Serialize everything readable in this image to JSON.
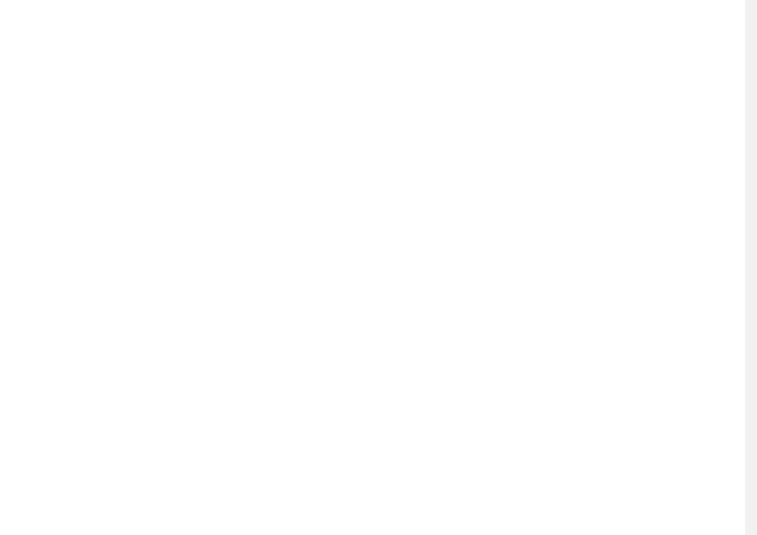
{
  "colors": {
    "line": "#333333",
    "dot": "#111111",
    "big_arrow": "#8a8a8a",
    "edge_strip": "#f1f1f1"
  },
  "top_row": [
    {
      "id": "normal",
      "caption": "Normal field",
      "north_label": "N",
      "center": [
        141,
        162
      ],
      "radius": 9,
      "caption_pos": [
        141,
        269
      ],
      "north_pos": [
        141,
        71
      ],
      "long_arrows": [
        {
          "angle": 90,
          "len": 85
        },
        {
          "angle": 270,
          "len": 100
        },
        {
          "angle": 0,
          "len": 98
        },
        {
          "angle": 180,
          "len": 98
        },
        {
          "angle": 45,
          "len": 75
        },
        {
          "angle": 135,
          "len": 75
        },
        {
          "angle": 225,
          "len": 65
        },
        {
          "angle": 315,
          "len": 75
        }
      ],
      "short_arrows_inward": [
        70,
        110,
        20,
        160,
        200,
        250,
        290,
        340
      ]
    },
    {
      "id": "strong",
      "caption": "9 times stronger field",
      "north_label": "N",
      "center": [
        405,
        162
      ],
      "radius": 9,
      "caption_pos": [
        405,
        289
      ],
      "north_pos": [
        405,
        35
      ],
      "long_arrows": [
        {
          "angle": 90,
          "len": 120
        },
        {
          "angle": 270,
          "len": 112
        },
        {
          "angle": 0,
          "len": 112
        },
        {
          "angle": 180,
          "len": 112
        },
        {
          "angle": 45,
          "len": 55
        },
        {
          "angle": 135,
          "len": 55
        },
        {
          "angle": 225,
          "len": 42
        },
        {
          "angle": 315,
          "len": 52
        }
      ],
      "short_arrows_inward": [
        70,
        110,
        20,
        160,
        200,
        250,
        290,
        340
      ]
    },
    {
      "id": "null",
      "caption": "Approximately null field",
      "north_label": "N",
      "center": [
        646,
        161
      ],
      "radius": 9,
      "caption_pos": [
        646,
        231
      ],
      "north_pos": [
        646,
        106
      ],
      "long_arrows": [
        {
          "angle": 90,
          "len": 50
        },
        {
          "angle": 270,
          "len": 50
        },
        {
          "angle": 0,
          "len": 62
        },
        {
          "angle": 180,
          "len": 62
        },
        {
          "angle": 45,
          "len": 55
        },
        {
          "angle": 135,
          "len": 55
        },
        {
          "angle": 225,
          "len": 55
        },
        {
          "angle": 315,
          "len": 55
        },
        {
          "angle": 22.5,
          "len": 45
        },
        {
          "angle": 67.5,
          "len": 45
        },
        {
          "angle": 112.5,
          "len": 45
        },
        {
          "angle": 157.5,
          "len": 45
        },
        {
          "angle": 202.5,
          "len": 45
        },
        {
          "angle": 247.5,
          "len": 45
        },
        {
          "angle": 292.5,
          "len": 45
        },
        {
          "angle": 337.5,
          "len": 45
        }
      ],
      "short_arrows_inward": []
    }
  ],
  "bottom_row": [
    {
      "id": "apis",
      "species": "Apis mellifera",
      "center": [
        141,
        404
      ],
      "radius": 75,
      "labels": [
        {
          "text": "90°",
          "angle": 90,
          "tick": true
        },
        {
          "text": "0°",
          "angle": 180,
          "tick": true
        },
        {
          "text": "180°",
          "angle": 0,
          "tick": true
        },
        {
          "text": "270°",
          "angle": 270,
          "tick": true
        }
      ],
      "big_arrows": [
        {
          "type": "double",
          "x1": 82,
          "x2": 180,
          "y": 404
        }
      ],
      "inner_arrows": [],
      "dot_clusters": [
        {
          "from": 58,
          "to": 122,
          "step": 4,
          "depths": [
            3,
            5,
            6,
            7,
            8,
            9,
            9,
            9,
            8,
            8,
            6,
            6,
            5,
            5,
            4,
            3,
            3
          ]
        },
        {
          "from": 28,
          "to": 52,
          "step": 6,
          "depths": [
            2,
            3,
            3,
            4,
            2
          ]
        },
        {
          "from": -20,
          "to": 20,
          "step": 5,
          "depths": [
            2,
            2,
            3,
            4,
            5,
            6,
            5,
            4,
            3
          ]
        },
        {
          "from": 128,
          "to": 150,
          "step": 7,
          "depths": [
            2,
            3,
            2,
            1
          ]
        },
        {
          "from": 160,
          "to": 200,
          "step": 5,
          "depths": [
            1,
            2,
            3,
            5,
            6,
            5,
            3,
            2,
            1
          ]
        },
        {
          "from": 205,
          "to": 230,
          "step": 6,
          "depths": [
            1,
            2,
            1,
            1,
            1
          ]
        },
        {
          "from": 238,
          "to": 302,
          "step": 4,
          "depths": [
            2,
            3,
            3,
            4,
            5,
            5,
            6,
            7,
            10,
            8,
            7,
            6,
            5,
            5,
            4,
            4,
            3
          ]
        },
        {
          "from": 308,
          "to": 335,
          "step": 6,
          "depths": [
            4,
            3,
            2,
            2,
            1
          ]
        }
      ]
    },
    {
      "id": "andrena",
      "species": "Andrena",
      "center": [
        406,
        404
      ],
      "radius": 75,
      "labels": [
        {
          "text": "90°",
          "angle": 90,
          "tick": true
        },
        {
          "text": "90°",
          "angle": 270,
          "tick": true
        },
        {
          "text": "45°",
          "angle": 135,
          "tick": true
        },
        {
          "text": "45°",
          "angle": 45,
          "tick": true
        },
        {
          "text": "45°",
          "angle": 225,
          "tick": true
        },
        {
          "text": "45°",
          "angle": 315,
          "tick": true
        }
      ],
      "big_arrows": [
        {
          "type": "left",
          "x1": 272,
          "x2": 330,
          "y": 404
        },
        {
          "type": "right",
          "x1": 482,
          "x2": 513,
          "y": 404
        }
      ],
      "inner_arrows": [
        {
          "angle": 45,
          "len": 28
        },
        {
          "angle": 135,
          "len": 28
        },
        {
          "angle": 225,
          "len": 28
        },
        {
          "angle": 315,
          "len": 28
        }
      ],
      "dot_clusters": [
        {
          "from": 100,
          "to": 130,
          "step": 5,
          "depths": [
            1,
            2,
            3,
            3,
            3,
            2,
            1
          ]
        },
        {
          "from": 136,
          "to": 158,
          "step": 5,
          "depths": [
            3,
            3,
            4,
            3,
            2
          ]
        },
        {
          "from": 168,
          "to": 185,
          "step": 6,
          "depths": [
            1,
            2,
            1
          ]
        },
        {
          "from": 192,
          "to": 196,
          "step": 5,
          "depths": [
            1
          ]
        },
        {
          "from": 62,
          "to": 80,
          "step": 5,
          "depths": [
            2,
            3,
            3,
            1
          ]
        },
        {
          "from": 35,
          "to": 55,
          "step": 5,
          "depths": [
            2,
            3,
            3,
            3,
            2
          ]
        },
        {
          "from": 8,
          "to": 30,
          "step": 5,
          "depths": [
            2,
            2,
            1,
            2,
            1
          ]
        },
        {
          "from": 218,
          "to": 232,
          "step": 6,
          "depths": [
            2,
            3,
            2
          ]
        },
        {
          "from": 236,
          "to": 262,
          "step": 5,
          "depths": [
            4,
            5,
            4,
            3,
            2,
            1
          ]
        },
        {
          "from": 268,
          "to": 300,
          "step": 7,
          "depths": [
            1,
            3,
            1,
            1,
            1
          ]
        },
        {
          "from": 305,
          "to": 340,
          "step": 5,
          "depths": [
            1,
            2,
            3,
            4,
            4,
            3,
            2,
            1
          ]
        }
      ]
    },
    {
      "id": "halictus",
      "species": "Halictus",
      "center": [
        646,
        404
      ],
      "radius": 75,
      "labels": [
        {
          "text": "90°",
          "angle": 90,
          "tick": true
        },
        {
          "text": "90°",
          "angle": 270,
          "tick": true
        },
        {
          "text": "45°",
          "angle": 135,
          "tick": true
        },
        {
          "text": "45°",
          "angle": 45,
          "tick": true
        },
        {
          "text": "45°",
          "angle": 225,
          "tick": true
        },
        {
          "text": "45°",
          "angle": 315,
          "tick": true
        }
      ],
      "big_arrows": [
        {
          "type": "left",
          "x1": 537,
          "x2": 570,
          "y": 404
        },
        {
          "type": "right",
          "x1": 722,
          "x2": 754,
          "y": 404
        }
      ],
      "inner_arrows": [
        {
          "angle": 0,
          "len": 30
        },
        {
          "angle": 45,
          "len": 30
        },
        {
          "angle": 90,
          "len": 30
        },
        {
          "angle": 135,
          "len": 30
        },
        {
          "angle": 180,
          "len": 30
        },
        {
          "angle": 225,
          "len": 30
        },
        {
          "angle": 270,
          "len": 30
        },
        {
          "angle": 315,
          "len": 30
        }
      ],
      "dot_clusters": [
        {
          "from": 76,
          "to": 104,
          "step": 5,
          "depths": [
            2,
            4,
            4,
            4,
            4,
            4,
            2
          ]
        },
        {
          "from": 110,
          "to": 122,
          "step": 6,
          "depths": [
            1,
            1,
            1
          ]
        },
        {
          "from": 128,
          "to": 150,
          "step": 5,
          "depths": [
            3,
            4,
            5,
            5,
            4
          ]
        },
        {
          "from": 155,
          "to": 168,
          "step": 6,
          "depths": [
            2,
            2,
            1
          ]
        },
        {
          "from": 172,
          "to": 192,
          "step": 5,
          "depths": [
            2,
            3,
            4,
            3,
            2
          ]
        },
        {
          "from": 196,
          "to": 212,
          "step": 6,
          "depths": [
            1,
            2,
            1
          ]
        },
        {
          "from": 40,
          "to": 62,
          "step": 5,
          "depths": [
            3,
            4,
            5,
            4,
            2
          ]
        },
        {
          "from": 20,
          "to": 32,
          "step": 6,
          "depths": [
            1,
            2,
            1
          ]
        },
        {
          "from": -8,
          "to": 16,
          "step": 4,
          "depths": [
            5,
            6,
            8,
            7,
            5,
            4,
            3
          ]
        },
        {
          "from": -28,
          "to": -12,
          "step": 6,
          "depths": [
            1,
            2,
            1
          ]
        },
        {
          "from": 218,
          "to": 236,
          "step": 5,
          "depths": [
            3,
            3,
            4,
            2
          ]
        },
        {
          "from": 244,
          "to": 296,
          "step": 5,
          "depths": [
            1,
            1,
            1,
            2,
            2,
            3,
            2,
            2,
            1,
            1,
            1
          ]
        },
        {
          "from": 300,
          "to": 322,
          "step": 5,
          "depths": [
            2,
            3,
            4,
            4,
            3
          ]
        },
        {
          "from": 326,
          "to": 336,
          "step": 6,
          "depths": [
            2,
            1
          ]
        }
      ]
    }
  ]
}
